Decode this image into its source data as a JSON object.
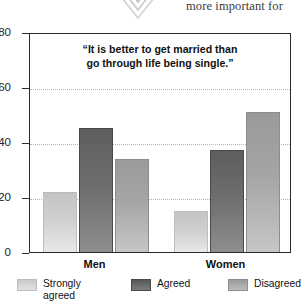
{
  "bleed": {
    "text_fragment": "more important for",
    "ornament": "chevron-ornament"
  },
  "chart_data": {
    "type": "bar",
    "title": "“It is better to get married than go through life being single.”",
    "title_line1": "“It is better to get married than",
    "title_line2": "go through life being single.”",
    "xlabel": "",
    "ylabel": "",
    "ylim": [
      0,
      80
    ],
    "yticks": [
      0,
      20,
      40,
      60,
      80
    ],
    "ytick_labels": [
      "0",
      "20",
      "40",
      "60",
      "80"
    ],
    "grid": true,
    "grid_axis": "y",
    "legend_position": "bottom",
    "categories": [
      "Men",
      "Women"
    ],
    "series": [
      {
        "name": "Strongly agreed",
        "values": [
          22,
          15
        ],
        "color": "#cfcfcf"
      },
      {
        "name": "Agreed",
        "values": [
          45,
          37
        ],
        "color": "#6d6d6d"
      },
      {
        "name": "Disagreed",
        "values": [
          34,
          51
        ],
        "color": "#a5a5a5"
      }
    ]
  }
}
